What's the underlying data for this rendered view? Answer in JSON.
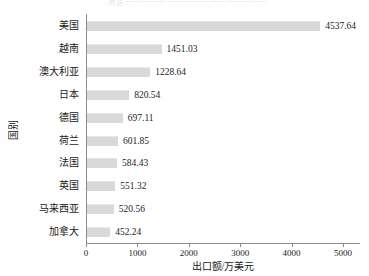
{
  "top_bleed_text": "表是一一一一一一一一一一一一一一一一一",
  "axes": {
    "ylabel": "国别",
    "xlabel": "出口额/万美元",
    "xticks": [
      "0",
      "1000",
      "2000",
      "3000",
      "4000",
      "5000"
    ]
  },
  "bar_color": "#d9d9d9",
  "axis_color": "#8d8d8d",
  "text_color": "#1a1a1a",
  "chart_data": {
    "type": "bar",
    "orientation": "horizontal",
    "title": "",
    "xlabel": "出口额/万美元",
    "ylabel": "国别",
    "xlim": [
      0,
      5000
    ],
    "xticks": [
      0,
      1000,
      2000,
      3000,
      4000,
      5000
    ],
    "grid": false,
    "legend": false,
    "categories": [
      "美国",
      "越南",
      "澳大利亚",
      "日本",
      "德国",
      "荷兰",
      "法国",
      "英国",
      "马来西亚",
      "加拿大"
    ],
    "values": [
      4537.64,
      1451.03,
      1228.64,
      820.54,
      697.11,
      601.85,
      584.43,
      551.32,
      520.56,
      452.24
    ],
    "value_labels": [
      "4537.64",
      "1451.03",
      "1228.64",
      "820.54",
      "697.11",
      "601.85",
      "584.43",
      "551.32",
      "520.56",
      "452.24"
    ]
  }
}
